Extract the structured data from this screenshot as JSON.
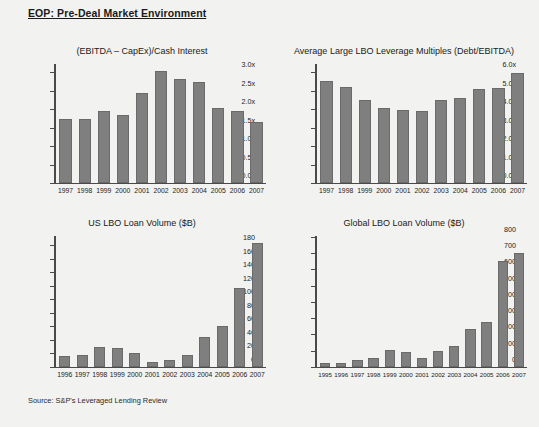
{
  "slide": {
    "title": "EOP: Pre-Deal Market Environment",
    "source": "Source: S&P's Leveraged Lending Review",
    "bar_color": "#7f7f7f",
    "background_color": "#f2f2f0",
    "axis_color": "#4a4a4a"
  },
  "chart_data": [
    {
      "id": "ebitda-capex-cash-interest",
      "type": "bar",
      "title": "(EBITDA – CapEx)/Cash Interest",
      "xlabel": "",
      "ylabel": "",
      "ylim": [
        0.0,
        3.25
      ],
      "yticks": [
        0.0,
        0.5,
        1.0,
        1.5,
        2.0,
        2.5,
        3.0
      ],
      "ytick_labels": [
        "0.0x",
        "0.5x",
        "1.0x",
        "1.5x",
        "2.0x",
        "2.5x",
        "3.0x"
      ],
      "grid": false,
      "legend": "none",
      "categories": [
        "1997",
        "1998",
        "1999",
        "2000",
        "2001",
        "2002",
        "2003",
        "2004",
        "2005",
        "2006",
        "2007"
      ],
      "values": [
        1.75,
        1.75,
        1.95,
        1.85,
        2.45,
        3.05,
        2.85,
        2.75,
        2.05,
        1.95,
        1.65
      ]
    },
    {
      "id": "large-lbo-leverage-multiples",
      "type": "bar",
      "title": "Average Large LBO Leverage Multiples (Debt/EBITDA)",
      "xlabel": "",
      "ylabel": "",
      "ylim": [
        0.0,
        6.5
      ],
      "yticks": [
        0.0,
        1.0,
        2.0,
        3.0,
        4.0,
        5.0,
        6.0
      ],
      "ytick_labels": [
        "0.0x",
        "1.0x",
        "2.0x",
        "3.0x",
        "4.0x",
        "5.0x",
        "6.0x"
      ],
      "grid": false,
      "legend": "none",
      "categories": [
        "1997",
        "1998",
        "1999",
        "2000",
        "2001",
        "2002",
        "2003",
        "2004",
        "2005",
        "2006",
        "2007"
      ],
      "values": [
        5.55,
        5.25,
        4.55,
        4.1,
        4.0,
        3.9,
        4.5,
        4.65,
        5.15,
        5.2,
        6.0
      ]
    },
    {
      "id": "us-lbo-loan-volume",
      "type": "bar",
      "title": "US LBO Loan Volume ($B)",
      "xlabel": "",
      "ylabel": "",
      "ylim": [
        0,
        195
      ],
      "yticks": [
        0,
        20,
        40,
        60,
        80,
        100,
        120,
        140,
        160,
        180
      ],
      "ytick_labels": [
        "0",
        "20",
        "40",
        "60",
        "80",
        "100",
        "120",
        "140",
        "160",
        "180"
      ],
      "grid": false,
      "legend": "none",
      "categories": [
        "1996",
        "1997",
        "1998",
        "1999",
        "2000",
        "2001",
        "2002",
        "2003",
        "2004",
        "2005",
        "2006",
        "2007"
      ],
      "values": [
        16,
        17,
        29,
        28,
        20,
        7,
        9,
        17,
        44,
        61,
        118,
        185
      ]
    },
    {
      "id": "global-lbo-loan-volume",
      "type": "bar",
      "title": "Global LBO Loan Volume ($B)",
      "xlabel": "",
      "ylabel": "",
      "ylim": [
        0,
        810
      ],
      "yticks": [
        0,
        100,
        200,
        300,
        400,
        500,
        600,
        700,
        800
      ],
      "ytick_labels": [
        "0",
        "100",
        "200",
        "300",
        "400",
        "500",
        "600",
        "700",
        "800"
      ],
      "grid": false,
      "legend": "none",
      "categories": [
        "1995",
        "1996",
        "1997",
        "1998",
        "1999",
        "2000",
        "2001",
        "2002",
        "2003",
        "2004",
        "2005",
        "2006",
        "2007"
      ],
      "values": [
        20,
        22,
        43,
        54,
        100,
        91,
        55,
        94,
        128,
        233,
        278,
        655,
        702
      ]
    }
  ]
}
